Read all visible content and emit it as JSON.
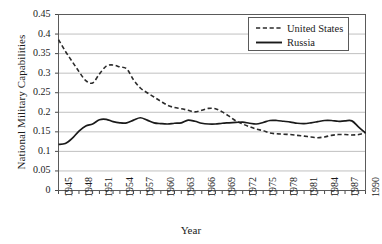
{
  "chart_data": {
    "type": "line",
    "title": "",
    "xlabel": "Year",
    "ylabel": "National Military Capabilities",
    "xlim": [
      1945,
      1990
    ],
    "ylim": [
      0,
      0.45
    ],
    "ytick_step": 0.05,
    "xtick_step": 3,
    "grid": "horizontal",
    "legend_position": "top-right",
    "yticks": [
      "0",
      "0.05",
      "0.1",
      "0.15",
      "0.2",
      "0.25",
      "0.3",
      "0.35",
      "0.4",
      "0.45"
    ],
    "ytick_values": [
      0,
      0.05,
      0.1,
      0.15,
      0.2,
      0.25,
      0.3,
      0.35,
      0.4,
      0.45
    ],
    "xticks": [
      "1945",
      "1948",
      "1951",
      "1954",
      "1957",
      "1960",
      "1963",
      "1966",
      "1969",
      "1972",
      "1975",
      "1978",
      "1981",
      "1984",
      "1987",
      "1990"
    ],
    "x": [
      1945,
      1946,
      1947,
      1948,
      1949,
      1950,
      1951,
      1952,
      1953,
      1954,
      1955,
      1956,
      1957,
      1958,
      1959,
      1960,
      1961,
      1962,
      1963,
      1964,
      1965,
      1966,
      1967,
      1968,
      1969,
      1970,
      1971,
      1972,
      1973,
      1974,
      1975,
      1976,
      1977,
      1978,
      1979,
      1980,
      1981,
      1982,
      1983,
      1984,
      1985,
      1986,
      1987,
      1988,
      1989,
      1990
    ],
    "series": [
      {
        "name": "United States",
        "style": "dashed",
        "color": "#2b2b2b",
        "values": [
          0.386,
          0.356,
          0.33,
          0.304,
          0.281,
          0.275,
          0.298,
          0.318,
          0.321,
          0.316,
          0.311,
          0.283,
          0.262,
          0.25,
          0.239,
          0.228,
          0.218,
          0.212,
          0.209,
          0.205,
          0.201,
          0.205,
          0.21,
          0.209,
          0.201,
          0.19,
          0.178,
          0.17,
          0.163,
          0.157,
          0.153,
          0.147,
          0.145,
          0.144,
          0.143,
          0.141,
          0.139,
          0.137,
          0.135,
          0.137,
          0.141,
          0.143,
          0.143,
          0.142,
          0.143,
          0.148
        ]
      },
      {
        "name": "Russia",
        "style": "solid",
        "color": "#1a1a1a",
        "values": [
          0.118,
          0.12,
          0.133,
          0.152,
          0.165,
          0.17,
          0.181,
          0.182,
          0.176,
          0.173,
          0.173,
          0.18,
          0.186,
          0.18,
          0.173,
          0.171,
          0.17,
          0.172,
          0.173,
          0.18,
          0.177,
          0.172,
          0.17,
          0.17,
          0.172,
          0.173,
          0.174,
          0.175,
          0.172,
          0.17,
          0.174,
          0.179,
          0.179,
          0.177,
          0.175,
          0.172,
          0.171,
          0.173,
          0.176,
          0.179,
          0.179,
          0.177,
          0.178,
          0.178,
          0.162,
          0.147
        ]
      }
    ]
  },
  "legend": {
    "items": [
      {
        "label": "United States"
      },
      {
        "label": "Russia"
      }
    ]
  }
}
